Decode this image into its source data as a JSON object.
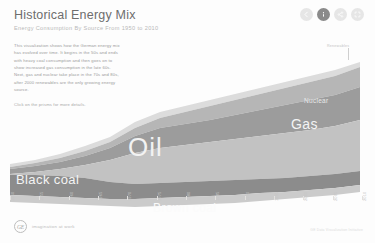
{
  "header": {
    "title": "Historical Energy Mix",
    "subtitle": "Energy Consumption By Source From 1950 to 2010"
  },
  "nav": {
    "buttons": [
      {
        "name": "back",
        "icon": "arrow-left-icon",
        "active": false
      },
      {
        "name": "info",
        "icon": "info-icon",
        "active": true
      },
      {
        "name": "share",
        "icon": "share-icon",
        "active": false
      },
      {
        "name": "fullscreen",
        "icon": "expand-icon",
        "active": false
      }
    ]
  },
  "intro": {
    "body": "This visualization shows how the German energy mix has evolved over time. It begins in the 50s and ends with heavy coal consumption and then goes on to show increased gas consumption in the late 60s. Next, gas and nuclear take place in the 70s and 80s, after 2000 renewables are the only growing energy source.",
    "cta": "Click on the prisms for more details."
  },
  "annotations": {
    "renewables": "Renewables"
  },
  "footer": {
    "brand": "GE",
    "tagline": "imagination at work",
    "credit": "GE Data Visualization Initiative"
  },
  "chart_data": {
    "type": "area",
    "title": "Historical Energy Mix",
    "subtitle": "Energy Consumption By Source From 1950 to 2010",
    "xlabel": "",
    "ylabel": "",
    "xlim": [
      1950,
      2010
    ],
    "grid": false,
    "legend": "inline-labels",
    "stacked": true,
    "stream_offset": "wiggle",
    "x": [
      1950,
      1955,
      1960,
      1965,
      1970,
      1975,
      1980,
      1985,
      1990,
      1995,
      2000,
      2005,
      2010
    ],
    "tick_labels": [
      "1950",
      "1955",
      "1960",
      "1965",
      "1970",
      "1975",
      "1980",
      "1985",
      "1990",
      "1995",
      "2000",
      "2005",
      "2010"
    ],
    "series": [
      {
        "name": "Brown coal",
        "color": "#c9c9c9",
        "values": [
          30,
          31,
          32,
          31,
          30,
          30,
          31,
          32,
          30,
          26,
          25,
          25,
          24
        ]
      },
      {
        "name": "Black coal",
        "color": "#8f8f8f",
        "values": [
          48,
          45,
          42,
          36,
          30,
          27,
          26,
          25,
          23,
          21,
          20,
          20,
          19
        ]
      },
      {
        "name": "Oil",
        "color": "#bfbfbf",
        "values": [
          6,
          12,
          22,
          38,
          53,
          52,
          50,
          42,
          40,
          40,
          39,
          37,
          35
        ]
      },
      {
        "name": "Gas",
        "color": "#9a9a9a",
        "values": [
          1,
          2,
          3,
          5,
          12,
          16,
          18,
          20,
          22,
          24,
          25,
          26,
          27
        ]
      },
      {
        "name": "Nuclear",
        "color": "#b4b4b4",
        "values": [
          0,
          0,
          0,
          1,
          2,
          5,
          9,
          14,
          15,
          15,
          14,
          13,
          12
        ]
      },
      {
        "name": "Renewables",
        "color": "#dadada",
        "values": [
          0,
          0,
          0,
          0,
          0,
          1,
          1,
          1,
          2,
          3,
          4,
          7,
          11
        ]
      }
    ]
  }
}
